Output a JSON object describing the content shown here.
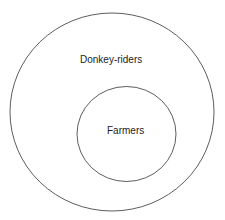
{
  "diagram": {
    "type": "euler-diagram",
    "outer_set": {
      "label": "Donkey-riders"
    },
    "inner_set": {
      "label": "Farmers"
    },
    "stroke_color": "#333333",
    "background": "#ffffff"
  }
}
